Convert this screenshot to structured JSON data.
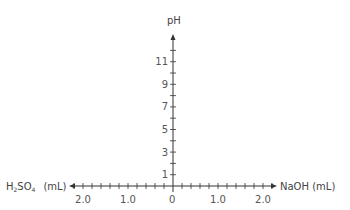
{
  "chart_data": {
    "type": "line",
    "title": "",
    "ylabel": "pH",
    "xlabel_right": "NaOH (mL)",
    "xlabel_left_parts": {
      "h": "H",
      "sub2": "2",
      "so": "SO",
      "sub4": "4",
      "unit": "(mL)"
    },
    "xlabel_left": "H2SO4 (mL)",
    "y_ticks": [
      1,
      3,
      5,
      7,
      9,
      11
    ],
    "y_minor_ticks": [
      1,
      2,
      3,
      4,
      5,
      6,
      7,
      8,
      9,
      10,
      11,
      12
    ],
    "ylim": [
      0,
      13
    ],
    "x_tick_labels_left": [
      "2.0",
      "1.0"
    ],
    "x_tick_labels_right": [
      "1.0",
      "2.0"
    ],
    "origin_label": "0",
    "xlim_left": [
      0,
      2.2
    ],
    "xlim_right": [
      0,
      2.2
    ],
    "x_minor_step": 0.2,
    "grid": false,
    "series": []
  },
  "colors": {
    "axis": "#333333",
    "text": "#555555"
  }
}
